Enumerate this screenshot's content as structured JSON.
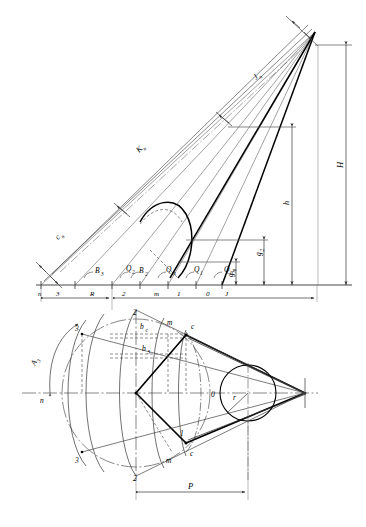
{
  "figure": {
    "line_color": "#1a1a1a",
    "thin_color": "#555555",
    "heavy_color": "#000000"
  },
  "upper_view": {
    "name": "elevation-view",
    "baseline_points": [
      {
        "id": "n",
        "label": "n"
      },
      {
        "id": "3",
        "label": "3"
      },
      {
        "id": "R",
        "label": "R"
      },
      {
        "id": "2",
        "label": "2"
      },
      {
        "id": "m",
        "label": "m"
      },
      {
        "id": "1",
        "label": "1"
      },
      {
        "id": "0",
        "label": "0"
      },
      {
        "id": "J",
        "label": "J"
      }
    ],
    "angle_labels": [
      {
        "id": "B3",
        "base": "B",
        "sub": "3"
      },
      {
        "id": "Q2",
        "base": "Q",
        "sub": "2"
      },
      {
        "id": "B2",
        "base": "B",
        "sub": "2"
      },
      {
        "id": "Qm",
        "base": "Q",
        "sub": "m"
      },
      {
        "id": "Q1",
        "base": "Q",
        "sub": "1"
      },
      {
        "id": "Q0",
        "base": "Q",
        "sub": "0"
      }
    ],
    "diagonal_labels": [
      {
        "id": "Kn",
        "base": "K",
        "sub": "n"
      },
      {
        "id": "cn",
        "base": "c",
        "sub": "n"
      },
      {
        "id": "Jn",
        "base": "J",
        "sub": "n"
      }
    ],
    "vertical_dimensions": [
      {
        "id": "H",
        "base": "H",
        "sub": ""
      },
      {
        "id": "h",
        "base": "h",
        "sub": ""
      },
      {
        "id": "g2",
        "base": "g",
        "sub": "2"
      },
      {
        "id": "gm",
        "base": "g",
        "sub": "m"
      }
    ]
  },
  "lower_view": {
    "name": "plan-view",
    "point_labels": [
      {
        "id": "2-top",
        "label": "2"
      },
      {
        "id": "3-top",
        "label": "3"
      },
      {
        "id": "m-top",
        "label": "m"
      },
      {
        "id": "c-top",
        "label": "c"
      },
      {
        "id": "n-axis",
        "label": "n"
      },
      {
        "id": "0-center",
        "label": "0"
      },
      {
        "id": "1-bottom",
        "label": "1"
      },
      {
        "id": "c-bottom",
        "label": "c"
      },
      {
        "id": "m-bottom",
        "label": "m"
      },
      {
        "id": "3-bottom",
        "label": "3"
      },
      {
        "id": "2-bottom",
        "label": "2"
      }
    ],
    "dimension_labels": [
      {
        "id": "bc",
        "base": "b",
        "sub": "c"
      },
      {
        "id": "b3",
        "base": "b",
        "sub": "3"
      },
      {
        "id": "A3",
        "base": "A",
        "sub": "3"
      },
      {
        "id": "r",
        "base": "r",
        "sub": ""
      },
      {
        "id": "P",
        "base": "P",
        "sub": ""
      }
    ]
  }
}
